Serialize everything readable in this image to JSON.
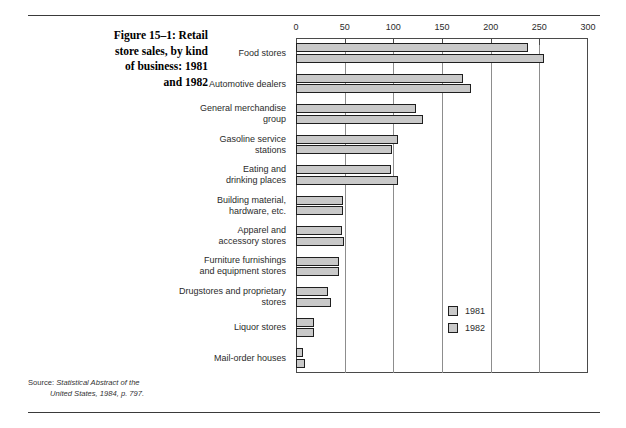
{
  "caption": {
    "lines": [
      "Figure 15–1: Retail",
      "store sales, by kind",
      "of business: 1981",
      "and 1982"
    ]
  },
  "source": {
    "label": "Source:",
    "line1": "Statistical Abstract of the",
    "line2": "United States, 1984, p. 797."
  },
  "legend": {
    "items": [
      {
        "label": "1981"
      },
      {
        "label": "1982"
      }
    ]
  },
  "chart_data": {
    "type": "bar",
    "orientation": "horizontal",
    "xlabel": "",
    "ylabel": "",
    "xlim": [
      0,
      300
    ],
    "xticks": [
      0,
      50,
      100,
      150,
      200,
      250,
      300
    ],
    "tick_labels": [
      "0",
      "50",
      "100",
      "150",
      "200",
      "250",
      "300"
    ],
    "grid": true,
    "legend_position": "inside-lower-right",
    "categories": [
      "Food stores",
      "Automotive dealers",
      "General merchandise group",
      "Gasoline service stations",
      "Eating and drinking places",
      "Building material, hardware, etc.",
      "Apparel and accessory stores",
      "Furniture furnishings and equipment stores",
      "Drugstores and proprietary stores",
      "Liquor stores",
      "Mail-order houses"
    ],
    "category_label_lines": [
      [
        "Food stores"
      ],
      [
        "Automotive dealers"
      ],
      [
        "General merchandise",
        "group"
      ],
      [
        "Gasoline service",
        "stations"
      ],
      [
        "Eating and",
        "drinking places"
      ],
      [
        "Building material,",
        "hardware, etc."
      ],
      [
        "Apparel and",
        "accessory stores"
      ],
      [
        "Furniture furnishings",
        "and equipment stores"
      ],
      [
        "Drugstores and proprietary",
        "stores"
      ],
      [
        "Liquor stores"
      ],
      [
        "Mail-order houses"
      ]
    ],
    "series": [
      {
        "name": "1981",
        "values": [
          238,
          172,
          123,
          105,
          98,
          48,
          47,
          44,
          33,
          18,
          7
        ]
      },
      {
        "name": "1982",
        "values": [
          255,
          180,
          130,
          99,
          105,
          48,
          49,
          44,
          36,
          19,
          9
        ]
      }
    ]
  }
}
